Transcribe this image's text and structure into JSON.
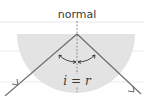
{
  "diagram": {
    "type": "total internal reflection in semicircular block",
    "labels": {
      "normal": "normal",
      "equation": "i = r"
    },
    "colors": {
      "block_fill": "#e3e3e3",
      "ray": "#6e6e6e",
      "normal_line": "#7a7a7a",
      "guide_lines": "#e6e6e6",
      "text": "#3a3a3a"
    },
    "geometry": {
      "block_center": [
        77,
        34
      ],
      "block_radius": 58,
      "incident_ray": {
        "from": [
          5,
          96
        ],
        "to": [
          77,
          34
        ]
      },
      "reflected_ray": {
        "from": [
          77,
          34
        ],
        "to": [
          140,
          94
        ]
      },
      "normal_line": {
        "from": [
          77,
          22
        ],
        "to": [
          77,
          92
        ]
      }
    }
  }
}
